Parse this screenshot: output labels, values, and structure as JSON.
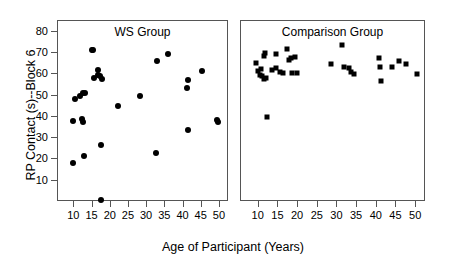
{
  "chart_data": {
    "type": "scatter",
    "title": "",
    "xlabel": "Age of Participant (Years)",
    "ylabel": "RP Contact (s)--Block 6",
    "xlim": [
      5.5,
      52.5
    ],
    "ylim": [
      0,
      85
    ],
    "xticks": [
      10,
      15,
      20,
      25,
      30,
      35,
      40,
      45,
      50
    ],
    "yticks": [
      10,
      20,
      30,
      40,
      50,
      60,
      70,
      80
    ],
    "grid": false,
    "legend": "none",
    "panels": [
      {
        "name": "ws",
        "label": "WS Group",
        "marker": "circle",
        "points": [
          {
            "x": 9.6,
            "y": 18.5
          },
          {
            "x": 9.7,
            "y": 38.0
          },
          {
            "x": 10.2,
            "y": 48.6
          },
          {
            "x": 11.6,
            "y": 50.0
          },
          {
            "x": 12.1,
            "y": 38.8
          },
          {
            "x": 12.3,
            "y": 51.2
          },
          {
            "x": 12.4,
            "y": 37.8
          },
          {
            "x": 12.7,
            "y": 21.8
          },
          {
            "x": 12.9,
            "y": 51.2
          },
          {
            "x": 14.9,
            "y": 71.2
          },
          {
            "x": 15.2,
            "y": 71.3
          },
          {
            "x": 15.3,
            "y": 58.0
          },
          {
            "x": 16.4,
            "y": 62.2
          },
          {
            "x": 16.5,
            "y": 59.6
          },
          {
            "x": 17.0,
            "y": 59.3
          },
          {
            "x": 17.2,
            "y": 27.0
          },
          {
            "x": 17.4,
            "y": 1.0
          },
          {
            "x": 17.6,
            "y": 57.7
          },
          {
            "x": 22.0,
            "y": 45.2
          },
          {
            "x": 28.0,
            "y": 49.8
          },
          {
            "x": 32.3,
            "y": 23.0
          },
          {
            "x": 32.6,
            "y": 66.0
          },
          {
            "x": 35.8,
            "y": 69.4
          },
          {
            "x": 41.0,
            "y": 53.4
          },
          {
            "x": 41.1,
            "y": 57.1
          },
          {
            "x": 41.3,
            "y": 34.0
          },
          {
            "x": 45.0,
            "y": 61.5
          },
          {
            "x": 49.3,
            "y": 38.6
          },
          {
            "x": 49.4,
            "y": 37.6
          }
        ]
      },
      {
        "name": "comparison",
        "label": "Comparison Group",
        "marker": "square",
        "points": [
          {
            "x": 9.3,
            "y": 65.5
          },
          {
            "x": 9.8,
            "y": 61.5
          },
          {
            "x": 10.2,
            "y": 59.8
          },
          {
            "x": 10.6,
            "y": 62.5
          },
          {
            "x": 10.8,
            "y": 59.0
          },
          {
            "x": 11.3,
            "y": 57.6
          },
          {
            "x": 11.4,
            "y": 68.5
          },
          {
            "x": 11.7,
            "y": 70.0
          },
          {
            "x": 11.9,
            "y": 58.2
          },
          {
            "x": 12.2,
            "y": 40.0
          },
          {
            "x": 13.3,
            "y": 62.0
          },
          {
            "x": 14.3,
            "y": 69.5
          },
          {
            "x": 14.5,
            "y": 63.0
          },
          {
            "x": 15.4,
            "y": 61.0
          },
          {
            "x": 16.1,
            "y": 60.5
          },
          {
            "x": 17.3,
            "y": 72.0
          },
          {
            "x": 17.6,
            "y": 66.5
          },
          {
            "x": 18.1,
            "y": 67.5
          },
          {
            "x": 18.4,
            "y": 60.5
          },
          {
            "x": 19.2,
            "y": 68.0
          },
          {
            "x": 19.6,
            "y": 60.8
          },
          {
            "x": 28.4,
            "y": 65.0
          },
          {
            "x": 31.2,
            "y": 73.5
          },
          {
            "x": 31.6,
            "y": 63.5
          },
          {
            "x": 32.9,
            "y": 63.0
          },
          {
            "x": 33.4,
            "y": 61.0
          },
          {
            "x": 34.2,
            "y": 60.2
          },
          {
            "x": 40.6,
            "y": 67.8
          },
          {
            "x": 40.9,
            "y": 63.2
          },
          {
            "x": 41.1,
            "y": 57.0
          },
          {
            "x": 43.8,
            "y": 63.3
          },
          {
            "x": 45.6,
            "y": 66.0
          },
          {
            "x": 47.3,
            "y": 65.0
          },
          {
            "x": 50.1,
            "y": 60.0
          }
        ]
      }
    ]
  },
  "colors": {
    "marker": "#000000",
    "axis": "#555555",
    "text": "#000000",
    "background": "#ffffff"
  }
}
